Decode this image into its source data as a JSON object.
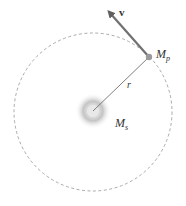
{
  "diagram": {
    "labels": {
      "velocity": "v",
      "planet_mass": "M",
      "planet_sub": "p",
      "radius": "r",
      "star_mass": "M",
      "star_sub": "s"
    },
    "colors": {
      "orbit": "#9a9a9a",
      "arrow": "#707070",
      "planet": "#9a9a9a",
      "star_glow": "#c8c8c8",
      "text": "#333333"
    }
  }
}
